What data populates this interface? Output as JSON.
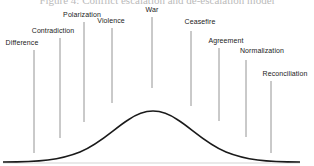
{
  "caption": "Figure 4: Conflict escalation and de-escalation model",
  "diagram": {
    "type": "bell-curve-stage-model",
    "peak_label": "War",
    "stages": [
      {
        "label": "Difference",
        "x": 34,
        "label_y": 39,
        "line_top": 50,
        "line_bottom": 153
      },
      {
        "label": "Contradiction",
        "x": 60,
        "label_y": 27,
        "line_top": 38,
        "line_bottom": 138
      },
      {
        "label": "Polarization",
        "x": 84,
        "label_y": 11,
        "line_top": 22,
        "line_bottom": 122
      },
      {
        "label": "Violence",
        "x": 112,
        "label_y": 17,
        "line_top": 28,
        "line_bottom": 103
      },
      {
        "label": "War",
        "x": 152,
        "label_y": 6,
        "line_top": 17,
        "line_bottom": 88
      },
      {
        "label": "Ceasefire",
        "x": 191,
        "label_y": 18,
        "line_top": 31,
        "line_bottom": 106
      },
      {
        "label": "Agreement",
        "x": 219,
        "label_y": 37,
        "line_top": 48,
        "line_bottom": 121
      },
      {
        "label": "Normalization",
        "x": 246,
        "label_y": 47,
        "line_top": 60,
        "line_bottom": 137
      },
      {
        "label": "Reconciliation",
        "x": 271,
        "label_y": 70,
        "line_top": 81,
        "line_bottom": 153
      }
    ],
    "curve": {
      "color": "#1a1a1a",
      "peak_x": 153,
      "peak_y": 111,
      "baseline_y": 162
    },
    "line_color": "#777777"
  }
}
